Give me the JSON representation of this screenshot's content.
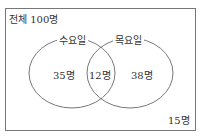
{
  "diagram": {
    "type": "venn",
    "universe_label": "전체 100명",
    "sets": [
      {
        "name": "수요일",
        "only_label": "35명"
      },
      {
        "name": "목요일",
        "only_label": "38명"
      }
    ],
    "intersection_label": "12명",
    "outside_label": "15명",
    "colors": {
      "line": "#777777",
      "text": "#333333"
    }
  }
}
